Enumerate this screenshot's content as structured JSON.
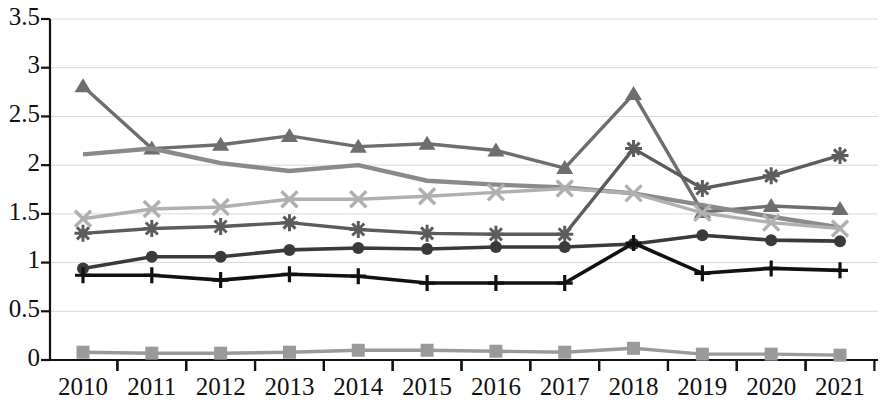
{
  "chart_data": {
    "type": "line",
    "title": "",
    "subtitle": "",
    "xlabel": "",
    "ylabel": "",
    "grid": true,
    "legend_position": "none",
    "xlim": [
      2010,
      2021
    ],
    "ylim": [
      0,
      3.5
    ],
    "y_ticks": [
      "0",
      "0.5",
      "1",
      "1.5",
      "2",
      "2.5",
      "3",
      "3.5"
    ],
    "y_tick_values": [
      0,
      0.5,
      1,
      1.5,
      2,
      2.5,
      3,
      3.5
    ],
    "categories": [
      "2010",
      "2011",
      "2012",
      "2013",
      "2014",
      "2015",
      "2016",
      "2017",
      "2018",
      "2019",
      "2020",
      "2021"
    ],
    "x": [
      2010,
      2011,
      2012,
      2013,
      2014,
      2015,
      2016,
      2017,
      2018,
      2019,
      2020,
      2021
    ],
    "series": [
      {
        "name": "Series 1",
        "marker": "triangle",
        "color": "#6e6e6e",
        "width": 3.4,
        "values": [
          2.81,
          2.17,
          2.21,
          2.3,
          2.19,
          2.22,
          2.15,
          1.97,
          2.73,
          1.52,
          1.58,
          1.55
        ]
      },
      {
        "name": "Series 2",
        "marker": "none",
        "color": "#8a8a8a",
        "width": 4.4,
        "values": [
          2.11,
          2.17,
          2.02,
          1.94,
          2.0,
          1.84,
          1.8,
          1.77,
          1.71,
          1.59,
          1.47,
          1.36
        ]
      },
      {
        "name": "Series 3",
        "marker": "x",
        "color": "#b0b0b0",
        "width": 3.4,
        "values": [
          1.45,
          1.55,
          1.57,
          1.65,
          1.65,
          1.68,
          1.72,
          1.76,
          1.71,
          1.51,
          1.41,
          1.35
        ]
      },
      {
        "name": "Series 4",
        "marker": "asterisk",
        "color": "#5c5c5c",
        "width": 3.4,
        "values": [
          1.3,
          1.35,
          1.37,
          1.41,
          1.34,
          1.3,
          1.29,
          1.29,
          2.17,
          1.76,
          1.89,
          2.1
        ]
      },
      {
        "name": "Series 5",
        "marker": "circle",
        "color": "#3a3a3a",
        "width": 3.6,
        "values": [
          0.94,
          1.06,
          1.06,
          1.13,
          1.15,
          1.14,
          1.16,
          1.16,
          1.19,
          1.28,
          1.23,
          1.22
        ]
      },
      {
        "name": "Series 6",
        "marker": "plus",
        "color": "#111111",
        "width": 3.6,
        "values": [
          0.87,
          0.87,
          0.82,
          0.88,
          0.86,
          0.79,
          0.79,
          0.79,
          1.2,
          0.89,
          0.94,
          0.92
        ]
      },
      {
        "name": "Series 7",
        "marker": "square",
        "color": "#9a9a9a",
        "width": 3.4,
        "values": [
          0.08,
          0.07,
          0.07,
          0.08,
          0.1,
          0.1,
          0.09,
          0.08,
          0.12,
          0.06,
          0.06,
          0.05
        ]
      }
    ]
  },
  "axes": {
    "x_tick_labels": [
      "2010",
      "2011",
      "2012",
      "2013",
      "2014",
      "2015",
      "2016",
      "2017",
      "2018",
      "2019",
      "2020",
      "2021"
    ],
    "y_tick_labels": [
      "3.5",
      "3",
      "2.5",
      "2",
      "1.5",
      "1",
      "0.5",
      "0"
    ]
  }
}
